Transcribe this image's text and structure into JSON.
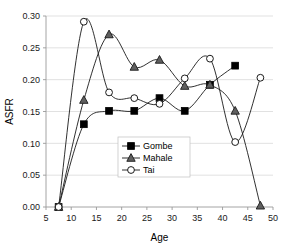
{
  "chart_data": {
    "type": "line",
    "title": "",
    "xlabel": "Age",
    "ylabel": "ASFR",
    "xlim": [
      5,
      50
    ],
    "ylim": [
      0.0,
      0.3
    ],
    "xticks": [
      5,
      10,
      15,
      20,
      25,
      30,
      35,
      40,
      45,
      50
    ],
    "yticks": [
      0.0,
      0.05,
      0.1,
      0.15,
      0.2,
      0.25,
      0.3
    ],
    "xtick_labels": [
      "5",
      "10",
      "15",
      "20",
      "25",
      "30",
      "35",
      "40",
      "45",
      "50"
    ],
    "ytick_labels": [
      "0.00",
      "0.05",
      "0.10",
      "0.15",
      "0.20",
      "0.25",
      "0.30"
    ],
    "grid": "horizontal",
    "legend_position": "center",
    "x": [
      7.5,
      12.5,
      17.5,
      22.5,
      27.5,
      32.5,
      37.5,
      42.5,
      47.5
    ],
    "series": [
      {
        "name": "Gombe",
        "marker": "filled-square",
        "color": "#000000",
        "values": [
          0.0,
          0.13,
          0.151,
          0.151,
          0.171,
          0.151,
          0.192,
          0.222,
          null
        ]
      },
      {
        "name": "Mahale",
        "marker": "filled-triangle",
        "color": "#595959",
        "values": [
          0.0,
          0.168,
          0.271,
          0.22,
          0.231,
          0.19,
          0.192,
          0.151,
          0.002
        ]
      },
      {
        "name": "Tai",
        "marker": "open-circle",
        "color": "#ffffff",
        "values": [
          0.0,
          0.291,
          0.18,
          0.171,
          0.162,
          0.202,
          0.233,
          0.102,
          0.203
        ]
      }
    ]
  },
  "axes": {
    "y_title": "ASFR",
    "x_title": "Age"
  },
  "legend": {
    "entries": [
      {
        "label": "Gombe"
      },
      {
        "label": "Mahale"
      },
      {
        "label": "Tai"
      }
    ]
  }
}
